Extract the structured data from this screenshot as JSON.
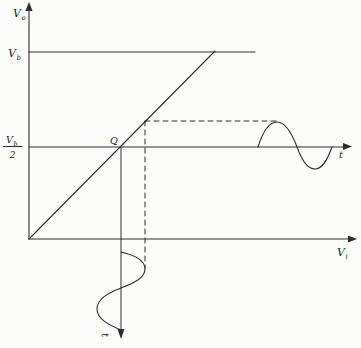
{
  "figure": {
    "name": "Amplifier transfer characteristic with Q-point biased at half the supply voltage, showing input and output sine waves",
    "colors": {
      "paper": "#fcfcfb",
      "line": "#2e2e2e",
      "ink": "#1d1d1d"
    },
    "labels": {
      "y_axis": {
        "base": "V",
        "sub": "o"
      },
      "x_axis": {
        "base": "V",
        "sub": "i"
      },
      "saturation_level": {
        "base": "V",
        "sub": "b"
      },
      "mid_level_fraction": {
        "numerator_base": "V",
        "numerator_sub": "b",
        "denominator": "2"
      },
      "q_point": "Q",
      "output_time_axis": "t",
      "input_time_axis": "t"
    },
    "semantics": {
      "description": "Linear transfer curve V_o vs V_i rising from the origin and saturating at V_b; quiescent point Q sits at output level V_b/2; a sinusoidal input drawn downward from the V_i axis is mapped through the curve to a sinusoidal output drawn along the t axis at the V_b/2 level; dashed guide lines connect the input peak via the transfer curve to the output peak.",
      "curve_type": "piecewise-linear",
      "q_point_output_level": "V_b/2",
      "saturation_output_level": "V_b"
    }
  }
}
